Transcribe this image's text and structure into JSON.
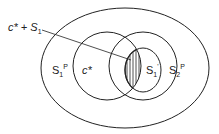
{
  "diagram": {
    "labels": {
      "leader": {
        "main": "c* + S",
        "sub": "1"
      },
      "s1p": {
        "main": "S",
        "sub": "1",
        "sup": "P"
      },
      "cstar": {
        "main": "c*"
      },
      "s1prime": {
        "main": "S",
        "sub": "1",
        "sup": "'"
      },
      "s2p": {
        "main": "S",
        "sub": "2",
        "sup": "P"
      }
    },
    "colors": {
      "stroke": "#222222",
      "background": "#ffffff"
    }
  }
}
